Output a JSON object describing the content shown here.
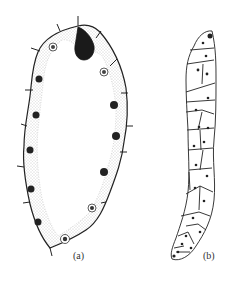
{
  "figure": {
    "panels": [
      {
        "id": "a",
        "label": "(a)",
        "description": "elongated ovoid cell with dark apical teardrop body, granular peripheral layer, nuclei along margin and short radiating spines"
      },
      {
        "id": "b",
        "label": "(b)",
        "description": "curved filament composed of polygonal cells each with a central dot nucleus, darker tip at top"
      }
    ],
    "colors": {
      "ink": "#222222",
      "stipple": "#9a9a9a",
      "background": "#ffffff"
    }
  }
}
